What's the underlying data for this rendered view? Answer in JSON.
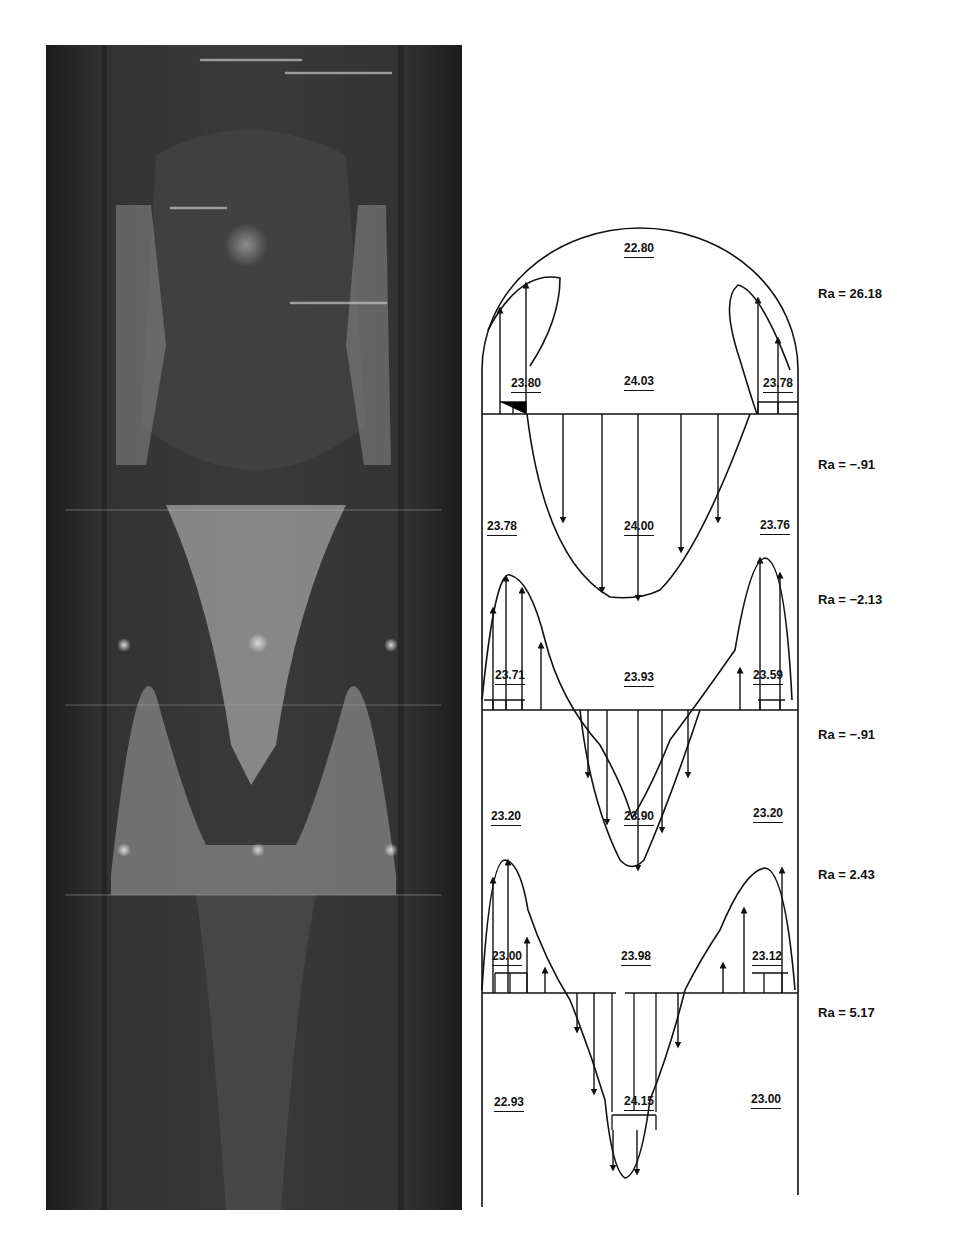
{
  "figure": {
    "photo": {
      "description": "Flow visualization photograph of convection cells in a vertical channel",
      "tone": "grayscale"
    },
    "diagram": {
      "cells": [
        {
          "index": 0,
          "region": "top-dome",
          "center_value": "22.80",
          "left_value": "23.80",
          "right_value": "23.78",
          "core_value": "24.03"
        },
        {
          "index": 1,
          "left_value": "23.78",
          "center_value": "24.00",
          "right_value": "23.76"
        },
        {
          "index": 2,
          "left_value": "23.71",
          "center_value": "23.93",
          "right_value": "23.59"
        },
        {
          "index": 3,
          "left_value": "23.20",
          "center_value": "23.90",
          "right_value": "23.20"
        },
        {
          "index": 4,
          "left_value": "23.00",
          "center_value": "23.98",
          "right_value": "23.12"
        },
        {
          "index": 5,
          "left_value": "22.93",
          "center_value": "24.15",
          "right_value": "23.00"
        }
      ]
    },
    "ra_labels": [
      {
        "text": "Ra = 26.18",
        "y": 294
      },
      {
        "text": "Ra = −.91",
        "y": 465
      },
      {
        "text": "Ra = −2.13",
        "y": 600
      },
      {
        "text": "Ra = −.91",
        "y": 735
      },
      {
        "text": "Ra = 2.43",
        "y": 875
      },
      {
        "text": "Ra = 5.17",
        "y": 1013
      }
    ],
    "values": {
      "v0": "22.80",
      "v1": "23.80",
      "v2": "24.03",
      "v3": "23.78",
      "v4": "23.78",
      "v5": "24.00",
      "v6": "23.76",
      "v7": "23.71",
      "v8": "23.93",
      "v9": "23.59",
      "v10": "23.20",
      "v11": "23.90",
      "v12": "23.20",
      "v13": "23.00",
      "v14": "23.98",
      "v15": "23.12",
      "v16": "22.93",
      "v17": "24.15",
      "v18": "23.00"
    }
  }
}
